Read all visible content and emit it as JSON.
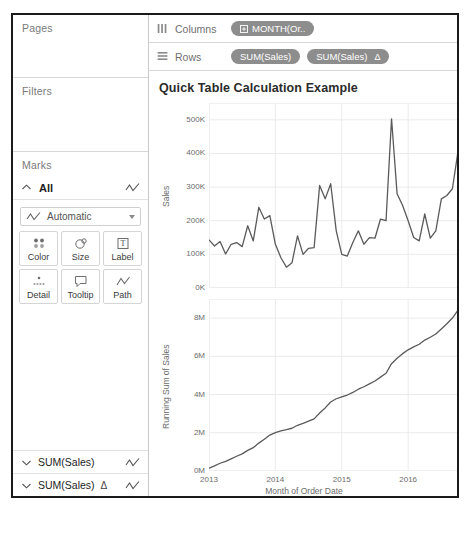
{
  "shelves": {
    "pages": {
      "label": "Pages"
    },
    "filters": {
      "label": "Filters"
    },
    "marks": {
      "label": "Marks",
      "all_label": "All",
      "mark_type": "Automatic",
      "buttons": [
        {
          "label": "Color",
          "icon": "color-dots-icon"
        },
        {
          "label": "Size",
          "icon": "size-circles-icon"
        },
        {
          "label": "Label",
          "icon": "label-text-icon"
        },
        {
          "label": "Detail",
          "icon": "detail-dots-icon"
        },
        {
          "label": "Tooltip",
          "icon": "tooltip-bubble-icon"
        },
        {
          "label": "Path",
          "icon": "path-line-icon"
        }
      ],
      "cards": [
        {
          "label": "SUM(Sales)",
          "delta": "",
          "icon": "line-mark-icon"
        },
        {
          "label": "SUM(Sales)",
          "delta": "Δ",
          "icon": "line-mark-icon"
        }
      ]
    },
    "columns": {
      "label": "Columns",
      "pills": [
        {
          "text": "MONTH(Or..",
          "icon": "plus-box-icon",
          "delta": ""
        }
      ]
    },
    "rows": {
      "label": "Rows",
      "pills": [
        {
          "text": "SUM(Sales)",
          "icon": "",
          "delta": ""
        },
        {
          "text": "SUM(Sales)",
          "icon": "",
          "delta": "Δ"
        }
      ]
    }
  },
  "view": {
    "title": "Quick Table Calculation Example"
  },
  "colors": {
    "pill": "#8d8d8d",
    "line": "#5a5a5a",
    "grid": "#ebebeb",
    "text": "#6c6c6c"
  },
  "chart_data": [
    {
      "type": "line",
      "id": "sales",
      "title": "",
      "xlabel": "",
      "ylabel": "Sales",
      "ylim": [
        0,
        550000
      ],
      "yticks": [
        0,
        100000,
        200000,
        300000,
        400000,
        500000
      ],
      "yticklabels": [
        "0K",
        "100K",
        "200K",
        "300K",
        "400K",
        "500K"
      ],
      "xlim": [
        0,
        47
      ],
      "xticks": [
        0,
        12,
        24,
        36,
        47
      ],
      "xticklabels": [
        "2013",
        "2014",
        "2015",
        "2016",
        "2017"
      ],
      "grid": true,
      "x": [
        0,
        1,
        2,
        3,
        4,
        5,
        6,
        7,
        8,
        9,
        10,
        11,
        12,
        13,
        14,
        15,
        16,
        17,
        18,
        19,
        20,
        21,
        22,
        23,
        24,
        25,
        26,
        27,
        28,
        29,
        30,
        31,
        32,
        33,
        34,
        35,
        36,
        37,
        38,
        39,
        40,
        41,
        42,
        43,
        44,
        45,
        46,
        47
      ],
      "values": [
        143000,
        125000,
        138000,
        101000,
        130000,
        135000,
        123000,
        185000,
        140000,
        240000,
        205000,
        215000,
        130000,
        90000,
        62000,
        75000,
        155000,
        100000,
        118000,
        120000,
        305000,
        265000,
        310000,
        170000,
        100000,
        95000,
        135000,
        170000,
        130000,
        150000,
        148000,
        205000,
        200000,
        503000,
        280000,
        245000,
        200000,
        150000,
        140000,
        220000,
        148000,
        170000,
        265000,
        275000,
        295000,
        405000,
        330000,
        248000
      ]
    },
    {
      "type": "line",
      "id": "running-sum",
      "title": "",
      "xlabel": "Month of Order Date",
      "ylabel": "Running Sum of Sales",
      "ylim": [
        0,
        9000000
      ],
      "yticks": [
        0,
        2000000,
        4000000,
        6000000,
        8000000
      ],
      "yticklabels": [
        "0M",
        "2M",
        "4M",
        "6M",
        "8M"
      ],
      "xlim": [
        0,
        47
      ],
      "xticks": [
        0,
        12,
        24,
        36,
        47
      ],
      "xticklabels": [
        "2013",
        "2014",
        "2015",
        "2016",
        "2017"
      ],
      "grid": true,
      "x": [
        0,
        1,
        2,
        3,
        4,
        5,
        6,
        7,
        8,
        9,
        10,
        11,
        12,
        13,
        14,
        15,
        16,
        17,
        18,
        19,
        20,
        21,
        22,
        23,
        24,
        25,
        26,
        27,
        28,
        29,
        30,
        31,
        32,
        33,
        34,
        35,
        36,
        37,
        38,
        39,
        40,
        41,
        42,
        43,
        44,
        45,
        46,
        47
      ],
      "values": [
        143000,
        268000,
        406000,
        507000,
        637000,
        772000,
        895000,
        1080000,
        1220000,
        1460000,
        1665000,
        1880000,
        2010000,
        2100000,
        2162000,
        2237000,
        2392000,
        2492000,
        2610000,
        2730000,
        3035000,
        3300000,
        3610000,
        3780000,
        3880000,
        3975000,
        4110000,
        4280000,
        4410000,
        4560000,
        4708000,
        4913000,
        5113000,
        5616000,
        5896000,
        6141000,
        6341000,
        6491000,
        6631000,
        6851000,
        6999000,
        7169000,
        7434000,
        7709000,
        8004000,
        8409000,
        8739000,
        8987000
      ]
    }
  ]
}
